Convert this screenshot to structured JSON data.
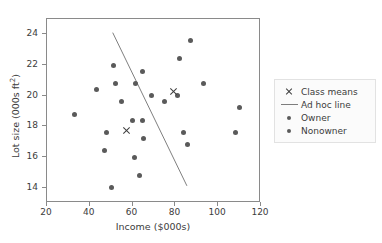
{
  "chart_data": {
    "type": "scatter",
    "title": "",
    "xlabel": "Income ($000s)",
    "ylabel": "Lot size (000s ft²)",
    "xlim": [
      20,
      120
    ],
    "ylim": [
      13.0,
      25.0
    ],
    "xticks": [
      20,
      40,
      60,
      80,
      100,
      120
    ],
    "yticks": [
      14,
      16,
      18,
      20,
      22,
      24
    ],
    "grid": false,
    "legend_position": "right",
    "legend": [
      {
        "key": "x-marker",
        "label": "Class means"
      },
      {
        "key": "line",
        "label": "Ad hoc line"
      },
      {
        "key": "dot",
        "label": "Owner"
      },
      {
        "key": "dot",
        "label": "Nonowner"
      }
    ],
    "series": [
      {
        "name": "Owner",
        "marker": "circle",
        "color": "#5a5a5a",
        "points": [
          [
            60,
            18.4
          ],
          [
            85.5,
            16.8
          ],
          [
            64.8,
            21.6
          ],
          [
            61.5,
            20.8
          ],
          [
            87,
            23.6
          ],
          [
            110,
            19.2
          ],
          [
            108,
            17.6
          ],
          [
            82,
            22.4
          ],
          [
            69,
            20.0
          ],
          [
            93,
            20.8
          ],
          [
            51,
            22.0
          ],
          [
            81,
            20.0
          ],
          [
            75,
            19.6
          ]
        ]
      },
      {
        "name": "Nonowner",
        "marker": "circle",
        "color": "#5a5a5a",
        "points": [
          [
            33,
            18.8
          ],
          [
            43,
            20.4
          ],
          [
            52,
            20.8
          ],
          [
            64.8,
            18.4
          ],
          [
            61,
            16.0
          ],
          [
            63,
            14.8
          ],
          [
            47,
            16.4
          ],
          [
            55,
            19.6
          ],
          [
            50,
            14.0
          ],
          [
            48,
            17.6
          ],
          [
            65,
            17.2
          ],
          [
            84,
            17.6
          ]
        ]
      },
      {
        "name": "Class means",
        "marker": "x",
        "color": "#3c3c3c",
        "points": [
          [
            57,
            17.7
          ],
          [
            79,
            20.3
          ]
        ]
      }
    ],
    "annotations": {
      "ad_hoc_line": {
        "label": "Ad hoc line",
        "color": "#7d7d7d",
        "x_start": 51,
        "y_start": 24.1,
        "x_end": 86,
        "y_end": 14.0
      }
    },
    "colors": {
      "axis": "#8a8a8a",
      "text": "#3c3c3c",
      "marker": "#5a5a5a",
      "line": "#7d7d7d",
      "background": "#ffffff",
      "legend_background": "#fbfbfb",
      "legend_border": "#e2e2e2"
    }
  }
}
